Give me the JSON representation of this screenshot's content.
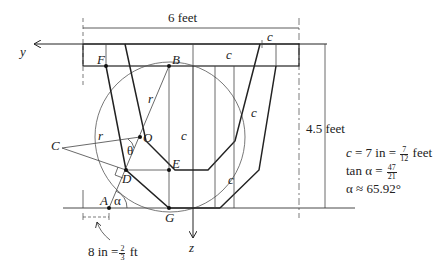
{
  "diagram": {
    "axes": {
      "y_label": "y",
      "z_label": "z"
    },
    "dimensions": {
      "width_label": "6 feet",
      "height_label": "4.5 feet",
      "c_label": "c",
      "offset_label_value": "8 in =",
      "offset_frac_num": "2",
      "offset_frac_den": "3",
      "offset_unit": "ft"
    },
    "points": {
      "A": "A",
      "B": "B",
      "C": "C",
      "D": "D",
      "E": "E",
      "F": "F",
      "G": "G",
      "O": "O"
    },
    "symbols": {
      "r": "r",
      "theta": "θ",
      "alpha": "α"
    },
    "equations": {
      "c_lhs": "c",
      "c_mid": " = 7 in = ",
      "c_frac_num": "7",
      "c_frac_den": "12",
      "c_unit": " feet",
      "tan_lhs": "tan α = ",
      "tan_frac_num": "47",
      "tan_frac_den": "21",
      "alpha_line": "α ≈ 65.92°"
    },
    "colors": {
      "line": "#222222",
      "thin": "#555555",
      "background": "#ffffff"
    }
  }
}
